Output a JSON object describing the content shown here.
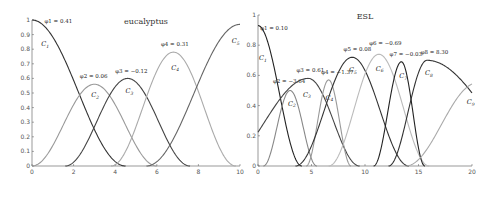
{
  "chart_data": [
    {
      "type": "line",
      "title": "eucalyptus",
      "xlim": [
        0,
        10
      ],
      "ylim": [
        0,
        1
      ],
      "xticks": [
        0,
        2,
        4,
        6,
        8,
        10
      ],
      "yticks": [
        0,
        0.1,
        0.2,
        0.3,
        0.4,
        0.5,
        0.6,
        0.7,
        0.8,
        0.9,
        1
      ],
      "grid": false,
      "series": [
        {
          "name": "C1",
          "color": "#333333",
          "peak_x": 0,
          "peak_y": 1.0,
          "left": 0,
          "right": 4.5,
          "annotation": "φ1 = 0.41",
          "ann_xy": [
            0.6,
            0.98
          ],
          "label_xy": [
            0.45,
            0.82
          ]
        },
        {
          "name": "C2",
          "color": "#999999",
          "peak_x": 3.0,
          "peak_y": 0.56,
          "left": 0.0,
          "right": 6.0,
          "annotation": "φ2 = 0.06",
          "ann_xy": [
            2.3,
            0.6
          ],
          "label_xy": [
            2.85,
            0.47
          ]
        },
        {
          "name": "C3",
          "color": "#444444",
          "peak_x": 4.6,
          "peak_y": 0.6,
          "left": 1.6,
          "right": 7.6,
          "annotation": "φ3 = −0.12",
          "ann_xy": [
            4.0,
            0.64
          ],
          "label_xy": [
            4.5,
            0.5
          ]
        },
        {
          "name": "C4",
          "color": "#aaaaaa",
          "peak_x": 6.8,
          "peak_y": 0.78,
          "left": 3.8,
          "right": 9.8,
          "annotation": "φ4 = 0.31",
          "ann_xy": [
            6.2,
            0.82
          ],
          "label_xy": [
            6.7,
            0.66
          ]
        },
        {
          "name": "C5",
          "color": "#666666",
          "peak_x": 10.0,
          "peak_y": 0.97,
          "left": 5.5,
          "right": 14.5,
          "annotation": "",
          "ann_xy": [
            0,
            0
          ],
          "label_xy": [
            9.6,
            0.84
          ]
        }
      ]
    },
    {
      "type": "line",
      "title": "ESL",
      "xlim": [
        0,
        20
      ],
      "ylim": [
        0,
        1
      ],
      "xticks": [
        0,
        5,
        10,
        15,
        20
      ],
      "yticks": [
        0,
        0.2,
        0.4,
        0.6,
        0.8,
        1
      ],
      "grid": false,
      "series": [
        {
          "name": "C1",
          "color": "#222222",
          "peak_x": 0,
          "peak_y": 0.93,
          "left": 0,
          "right": 4.1,
          "annotation": "φ1 = 0.10",
          "ann_xy": [
            0.2,
            0.9
          ],
          "label_xy": [
            0.1,
            0.7
          ]
        },
        {
          "name": "C2",
          "color": "#888888",
          "peak_x": 3.0,
          "peak_y": 0.5,
          "left": 0.5,
          "right": 5.5,
          "annotation": "φ2 = −3.64",
          "ann_xy": [
            1.4,
            0.55
          ],
          "label_xy": [
            2.8,
            0.4
          ]
        },
        {
          "name": "C3",
          "color": "#444444",
          "peak_x": 4.7,
          "peak_y": 0.58,
          "left": -3.5,
          "right": 9.5,
          "annotation": "φ3 = 0.61",
          "ann_xy": [
            3.6,
            0.62
          ],
          "label_xy": [
            4.2,
            0.46
          ]
        },
        {
          "name": "C4",
          "color": "#999999",
          "peak_x": 6.6,
          "peak_y": 0.57,
          "left": 4.5,
          "right": 8.7,
          "annotation": "φ4 = −1.37",
          "ann_xy": [
            5.9,
            0.61
          ],
          "label_xy": [
            6.3,
            0.44
          ]
        },
        {
          "name": "C5",
          "color": "#333333",
          "peak_x": 8.8,
          "peak_y": 0.72,
          "left": 3.5,
          "right": 14.1,
          "annotation": "φ5 = 0.08",
          "ann_xy": [
            8.0,
            0.76
          ],
          "label_xy": [
            8.5,
            0.62
          ]
        },
        {
          "name": "C6",
          "color": "#bbbbbb",
          "peak_x": 11.3,
          "peak_y": 0.74,
          "left": 6.6,
          "right": 16.0,
          "annotation": "φ6 = −0.69",
          "ann_xy": [
            10.4,
            0.8
          ],
          "label_xy": [
            11.0,
            0.63
          ]
        },
        {
          "name": "C7",
          "color": "#222222",
          "peak_x": 13.4,
          "peak_y": 0.69,
          "left": 10.8,
          "right": 15.6,
          "annotation": "φ7 = −0.03",
          "ann_xy": [
            12.3,
            0.73
          ],
          "label_xy": [
            13.2,
            0.58
          ]
        },
        {
          "name": "C8",
          "color": "#333333",
          "peak_x": 15.8,
          "peak_y": 0.7,
          "left": 12.2,
          "right": 27.0,
          "annotation": "φ8 = 8.30",
          "ann_xy": [
            15.2,
            0.74
          ],
          "label_xy": [
            15.6,
            0.6
          ]
        },
        {
          "name": "C9",
          "color": "#aaaaaa",
          "peak_x": 20.5,
          "peak_y": 0.55,
          "left": 13.8,
          "right": 27.2,
          "annotation": "",
          "ann_xy": [
            0,
            0
          ],
          "label_xy": [
            19.5,
            0.41
          ]
        }
      ]
    }
  ]
}
